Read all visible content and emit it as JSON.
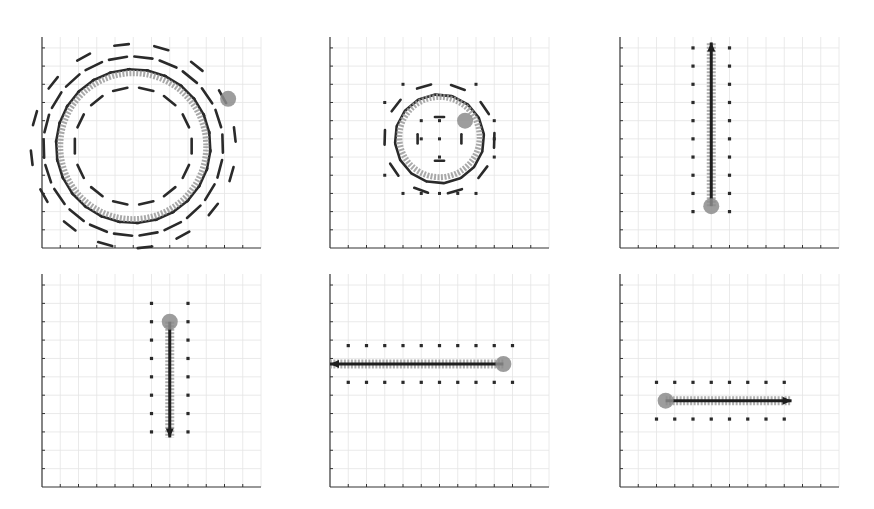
{
  "figure": {
    "layout": "2x3 grid of quiver/trajectory panels",
    "colors": {
      "axis": "#333333",
      "grid": "#e4e4e4",
      "field_arrow": "#2a2a2a",
      "trajectory": "#9a9a9a",
      "marker": "#8c8c8c",
      "main_arrow": "#1e1e1e"
    }
  },
  "chart_data": [
    {
      "id": "panel-1",
      "type": "quiver",
      "title": "",
      "xlabel": "",
      "ylabel": "",
      "grid": true,
      "xlim": [
        0,
        12
      ],
      "ylim": [
        0,
        11.6
      ],
      "description": "Large circular flow field (clockwise arrows on two concentric rings) with gray circular trajectory; gray blob marker at upper-right of circle",
      "circle": {
        "cx": 5.0,
        "cy": 5.6,
        "r": 4.2
      },
      "rings": [
        {
          "r": 3.2,
          "n": 14,
          "len": 0.8
        },
        {
          "r": 4.2,
          "n": 26,
          "len": 1.1
        },
        {
          "r": 4.9,
          "n": 22,
          "len": 1.0
        },
        {
          "r": 5.6,
          "n": 16,
          "len": 0.8
        }
      ],
      "marker": {
        "x": 10.2,
        "y": 8.2
      },
      "trajectory": {
        "type": "circle",
        "cx": 5.0,
        "cy": 5.6,
        "r": 4.0,
        "start_deg": 40,
        "end_deg": 400
      }
    },
    {
      "id": "panel-2",
      "type": "quiver",
      "title": "",
      "xlabel": "",
      "ylabel": "",
      "grid": true,
      "xlim": [
        0,
        12
      ],
      "ylim": [
        0,
        11.6
      ],
      "description": "Small circular flow field with gray ring trajectory; sparse dot grid; marker near upper-right of ring",
      "circle": {
        "cx": 6.0,
        "cy": 6.0,
        "r": 2.4
      },
      "rings": [
        {
          "r": 1.2,
          "n": 4,
          "len": 0.5
        },
        {
          "r": 2.4,
          "n": 16,
          "len": 0.9
        },
        {
          "r": 3.0,
          "n": 10,
          "len": 0.8
        }
      ],
      "dots": [
        [
          4,
          9
        ],
        [
          8,
          9
        ],
        [
          3,
          8
        ],
        [
          5,
          7
        ],
        [
          6,
          7
        ],
        [
          9,
          7
        ],
        [
          5,
          6
        ],
        [
          6,
          6
        ],
        [
          9,
          6
        ],
        [
          6,
          5
        ],
        [
          9,
          5
        ],
        [
          3,
          4
        ],
        [
          4,
          3
        ],
        [
          5,
          3
        ],
        [
          6,
          3
        ],
        [
          7,
          3
        ],
        [
          8,
          3
        ]
      ],
      "marker": {
        "x": 7.4,
        "y": 7.0
      },
      "trajectory": {
        "type": "circle",
        "cx": 6.0,
        "cy": 6.1,
        "r": 2.2,
        "start_deg": 30,
        "end_deg": 390
      }
    },
    {
      "id": "panel-3",
      "type": "quiver",
      "title": "",
      "xlabel": "",
      "ylabel": "",
      "grid": true,
      "xlim": [
        0,
        12
      ],
      "ylim": [
        0,
        11.6
      ],
      "description": "Vertical upward flow; main arrow from (5,2.3) to (5,11.4); dot columns at x=4 and x=6",
      "arrow": {
        "x1": 5.0,
        "y1": 2.3,
        "x2": 5.0,
        "y2": 11.3
      },
      "marker": {
        "x": 5.0,
        "y": 2.3
      },
      "dot_cols": {
        "xs": [
          4,
          6
        ],
        "ys": [
          2,
          3,
          4,
          5,
          6,
          7,
          8,
          9,
          10,
          11
        ]
      }
    },
    {
      "id": "panel-4",
      "type": "quiver",
      "title": "",
      "xlabel": "",
      "ylabel": "",
      "grid": true,
      "xlim": [
        0,
        12
      ],
      "ylim": [
        0,
        11.6
      ],
      "description": "Vertical downward flow; main arrow from (7,9) to (7,2.7); dot columns at x=6 and x=8",
      "arrow": {
        "x1": 7.0,
        "y1": 9.0,
        "x2": 7.0,
        "y2": 2.7
      },
      "marker": {
        "x": 7.0,
        "y": 9.0
      },
      "dot_cols": {
        "xs": [
          6,
          8
        ],
        "ys": [
          3,
          4,
          5,
          6,
          7,
          8,
          9,
          10
        ]
      }
    },
    {
      "id": "panel-5",
      "type": "quiver",
      "title": "",
      "xlabel": "",
      "ylabel": "",
      "grid": true,
      "xlim": [
        0,
        12
      ],
      "ylim": [
        0,
        11.6
      ],
      "description": "Horizontal leftward flow; main arrow from (9.5,6.7) to (0,6.7); dot rows at y=5.7 and y=7.7",
      "arrow": {
        "x1": 9.5,
        "y1": 6.7,
        "x2": 0.0,
        "y2": 6.7
      },
      "marker": {
        "x": 9.5,
        "y": 6.7
      },
      "dot_rows": {
        "ys": [
          5.7,
          7.7
        ],
        "xs": [
          1,
          2,
          3,
          4,
          5,
          6,
          7,
          8,
          9,
          10
        ]
      }
    },
    {
      "id": "panel-6",
      "type": "quiver",
      "title": "",
      "xlabel": "",
      "ylabel": "",
      "grid": true,
      "xlim": [
        0,
        12
      ],
      "ylim": [
        0,
        11.6
      ],
      "description": "Horizontal rightward flow; main arrow from (2.5,4.7) to (9.5,4.7); dot rows at y=3.7 and y=5.7",
      "arrow": {
        "x1": 2.5,
        "y1": 4.7,
        "x2": 9.4,
        "y2": 4.7
      },
      "marker": {
        "x": 2.5,
        "y": 4.7
      },
      "dot_rows": {
        "ys": [
          3.7,
          5.7
        ],
        "xs": [
          2,
          3,
          4,
          5,
          6,
          7,
          8,
          9
        ]
      }
    }
  ]
}
